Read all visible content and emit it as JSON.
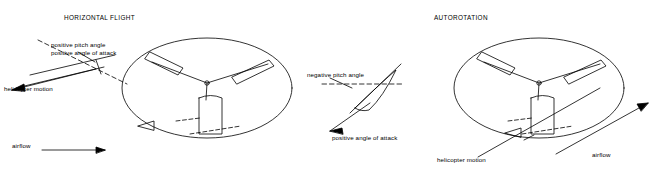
{
  "figure": {
    "background": "#ffffff",
    "ink": "#000000",
    "panels": [
      {
        "id": "horizontal-flight",
        "title": "HORIZONTAL FLIGHT",
        "labels": {
          "pitch_angle": "positive pitch angle",
          "angle_of_attack": "positive angle of attack",
          "helicopter_motion": "helicopter motion",
          "airflow": "airflow"
        }
      },
      {
        "id": "autorotation",
        "title": "AUTOROTATION",
        "labels": {
          "pitch_angle": "negative pitch angle",
          "angle_of_attack": "positive angle of attack",
          "helicopter_motion": "helicopter motion",
          "airflow": "airflow"
        }
      }
    ]
  }
}
